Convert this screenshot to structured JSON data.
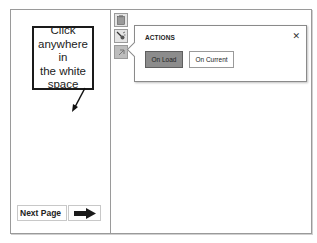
{
  "callout": {
    "lines": [
      "Click",
      "anywhere in",
      "the white",
      "space"
    ]
  },
  "navigation": {
    "next_page_label": "Next Page",
    "next_button_icon": "right-arrow-icon"
  },
  "toolbar": {
    "icons": [
      {
        "name": "clipboard-icon",
        "active": false
      },
      {
        "name": "macro-wand-icon",
        "active": false
      },
      {
        "name": "actions-icon",
        "active": true
      }
    ]
  },
  "actions_popup": {
    "title": "ACTIONS",
    "close_glyph": "✕",
    "buttons": [
      {
        "label": "On Load",
        "selected": true
      },
      {
        "label": "On Current",
        "selected": false
      }
    ]
  },
  "colors": {
    "frame_border": "#9a9a9a",
    "selected_button": "#8c8c8c",
    "callout_border": "#1a1a1a"
  }
}
